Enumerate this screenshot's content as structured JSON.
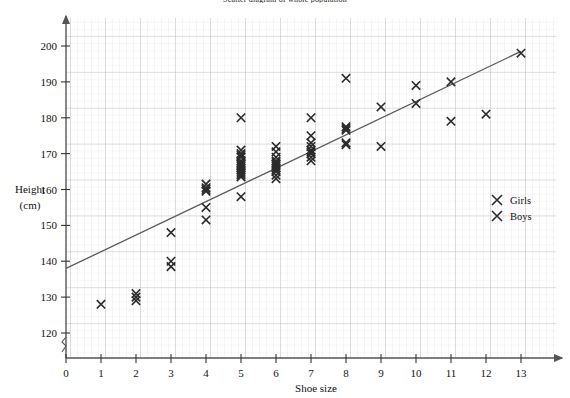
{
  "chart_data": {
    "type": "scatter",
    "title": "Scatter diagram of whole population",
    "xlabel": "Shoe size",
    "ylabel_line1": "Height",
    "ylabel_line2": "(cm)",
    "xlim": [
      0,
      13.8
    ],
    "ylim": [
      115,
      205
    ],
    "xticks": [
      0,
      1,
      2,
      3,
      4,
      5,
      6,
      7,
      8,
      9,
      10,
      11,
      12,
      13
    ],
    "yticks": [
      120,
      130,
      140,
      150,
      160,
      170,
      180,
      190,
      200
    ],
    "grid": "fine graph paper grid, major every 1 shoe size and 10 cm",
    "axis_break": "y-axis break between 0 and 120",
    "marker": "x",
    "marker_color": "#2b2b2b",
    "legend_position": "right-middle",
    "legend": [
      {
        "label": "Girls",
        "marker": "x"
      },
      {
        "label": "Boys",
        "marker": "x"
      }
    ],
    "trend_line": {
      "type": "line-of-best-fit",
      "color": "#5a5a5a",
      "x_start": 0,
      "y_start": 138,
      "x_end": 13,
      "y_end": 198.5
    },
    "series": [
      {
        "name": "Girls",
        "points": [
          [
            1,
            128
          ],
          [
            2,
            131
          ],
          [
            2,
            130
          ],
          [
            2,
            129
          ],
          [
            3,
            148
          ],
          [
            3,
            140
          ],
          [
            3,
            138.5
          ],
          [
            4,
            161.5
          ],
          [
            4,
            160.5
          ],
          [
            4,
            160
          ],
          [
            4,
            159.5
          ],
          [
            4,
            155
          ],
          [
            4,
            151.5
          ],
          [
            5,
            180
          ],
          [
            5,
            171
          ],
          [
            5,
            170
          ],
          [
            5,
            169.5
          ],
          [
            5,
            169
          ],
          [
            5,
            168
          ],
          [
            5,
            167.5
          ],
          [
            5,
            167
          ],
          [
            5,
            166.5
          ],
          [
            5,
            166
          ],
          [
            5,
            165.5
          ],
          [
            5,
            165
          ],
          [
            5,
            164.5
          ],
          [
            5,
            164
          ],
          [
            5,
            163.5
          ],
          [
            5,
            158
          ],
          [
            6,
            172
          ],
          [
            6,
            170.5
          ],
          [
            6,
            169
          ],
          [
            6,
            168
          ],
          [
            6,
            167.5
          ],
          [
            6,
            167
          ],
          [
            6,
            166.5
          ],
          [
            6,
            166
          ],
          [
            6,
            165.5
          ],
          [
            6,
            165
          ],
          [
            6,
            164
          ],
          [
            6,
            163
          ],
          [
            7,
            180
          ],
          [
            7,
            175
          ],
          [
            7,
            173
          ],
          [
            7,
            172
          ],
          [
            7,
            171
          ],
          [
            7,
            170.5
          ],
          [
            7,
            170
          ],
          [
            7,
            169
          ],
          [
            7,
            168
          ],
          [
            8,
            191
          ],
          [
            8,
            177.5
          ],
          [
            8,
            177
          ],
          [
            8,
            176.5
          ],
          [
            8,
            173
          ],
          [
            8,
            172.5
          ],
          [
            9,
            183
          ],
          [
            9,
            172
          ],
          [
            10,
            189
          ],
          [
            10,
            184
          ],
          [
            11,
            190
          ],
          [
            11,
            179
          ],
          [
            12,
            181
          ],
          [
            13,
            198
          ]
        ]
      }
    ]
  },
  "legend_box": {
    "girls": "Girls",
    "boys": "Boys"
  }
}
